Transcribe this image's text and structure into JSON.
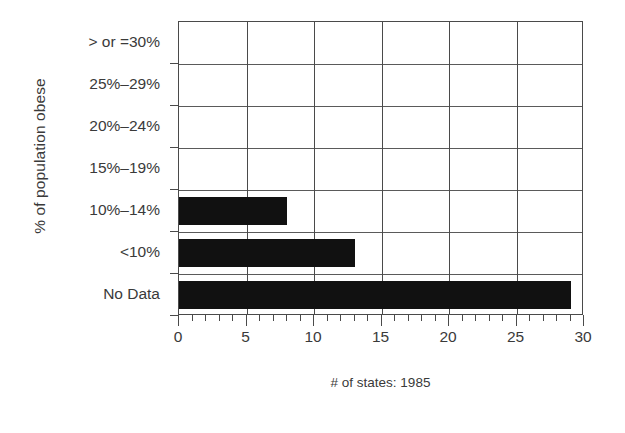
{
  "chart_data": {
    "type": "bar",
    "orientation": "horizontal",
    "title": "",
    "xlabel": "# of states: 1985",
    "ylabel": "% of population obese",
    "categories": [
      "No Data",
      "<10%",
      "10%–14%",
      "15%–19%",
      "20%–24%",
      "25%–29%",
      "> or =30%"
    ],
    "values": [
      29,
      13,
      8,
      0,
      0,
      0,
      0
    ],
    "xlim": [
      0,
      30
    ],
    "xticks": [
      0,
      5,
      10,
      15,
      20,
      25,
      30
    ],
    "xtick_labels": [
      "0",
      "5",
      "10",
      "15",
      "20",
      "25",
      "30"
    ],
    "minor_tick_step": 1,
    "grid": true,
    "legend": false,
    "bar_color": "#111111",
    "axis_color": "#4a4a4a",
    "text_color": "#3a3a3a",
    "background": "#ffffff"
  },
  "axes": {
    "y_title": "% of population obese",
    "x_title": "# of states: 1985",
    "y_categories_top_to_bottom": [
      {
        "label": "> or =30%",
        "value": 0
      },
      {
        "label": "25%–29%",
        "value": 0
      },
      {
        "label": "20%–24%",
        "value": 0
      },
      {
        "label": "15%–19%",
        "value": 0
      },
      {
        "label": "10%–14%",
        "value": 8
      },
      {
        "label": "<10%",
        "value": 13
      },
      {
        "label": "No Data",
        "value": 29
      }
    ],
    "x_tick_labels": [
      "0",
      "5",
      "10",
      "15",
      "20",
      "25",
      "30"
    ]
  }
}
